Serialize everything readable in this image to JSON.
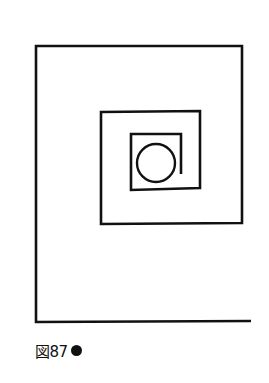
{
  "figure": {
    "caption_label": "図87",
    "caption_marker": "filled-circle",
    "stroke_color": "#111111",
    "background": "#ffffff",
    "spiral_points": [
      [
        251,
        321
      ],
      [
        36,
        322
      ],
      [
        36,
        46
      ],
      [
        242,
        46
      ],
      [
        242,
        223
      ],
      [
        101,
        224
      ],
      [
        101,
        112
      ],
      [
        200,
        111
      ],
      [
        200,
        188
      ],
      [
        131,
        190
      ],
      [
        131,
        134
      ],
      [
        181,
        134
      ],
      [
        181,
        174
      ]
    ],
    "circle": {
      "cx": 156,
      "cy": 163,
      "r": 19
    }
  }
}
